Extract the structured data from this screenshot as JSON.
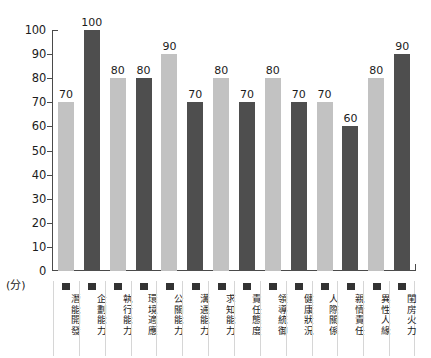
{
  "chart_data": {
    "type": "bar",
    "title": "",
    "xlabel": "",
    "ylabel": "",
    "unit_label": "(分)",
    "ylim": [
      0,
      100
    ],
    "ytick_step": 10,
    "grid": false,
    "legend_position": "below-axis-per-category",
    "categories": [
      "潛能開發",
      "企劃能力",
      "執行能力",
      "環境適應",
      "公關能力",
      "溝通能力",
      "求知能力",
      "責任態度",
      "領導統御",
      "健康狀況",
      "人際關係",
      "親情責任",
      "異性人緣",
      "閨房火力"
    ],
    "values": [
      70,
      100,
      80,
      80,
      90,
      70,
      80,
      70,
      80,
      70,
      70,
      60,
      80,
      90
    ],
    "bar_colors": [
      "#c2c2c2",
      "#4e4e4e",
      "#c2c2c2",
      "#4e4e4e",
      "#c2c2c2",
      "#4e4e4e",
      "#c2c2c2",
      "#4e4e4e",
      "#c2c2c2",
      "#4e4e4e",
      "#c2c2c2",
      "#4e4e4e",
      "#c2c2c2",
      "#4e4e4e"
    ],
    "yticks": [
      0,
      10,
      20,
      30,
      40,
      50,
      60,
      70,
      80,
      90,
      100
    ],
    "ytick_labels": [
      "0",
      "10",
      "20",
      "30",
      "40",
      "50",
      "60",
      "70",
      "80",
      "90",
      "100"
    ],
    "axis_color": "#4a4a4a",
    "legend_swatch_color": "#333333",
    "background_color": "#ffffff"
  }
}
